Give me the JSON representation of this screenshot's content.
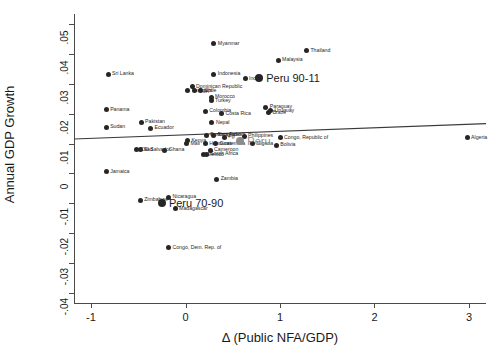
{
  "chart_data": {
    "type": "scatter",
    "title": "",
    "xlabel": "Δ (Public NFA/GDP)",
    "ylabel": "Annual GDP Growth",
    "xlim": [
      -1.18,
      3.18
    ],
    "ylim": [
      -0.0435,
      0.0535
    ],
    "xticks": [
      -1,
      0,
      1,
      2,
      3
    ],
    "xticklabels": [
      "-1",
      "0",
      "1",
      "2",
      "3"
    ],
    "yticks": [
      -0.04,
      -0.03,
      -0.02,
      -0.01,
      0,
      0.01,
      0.02,
      0.03,
      0.04,
      0.05
    ],
    "yticklabels": [
      "-.04",
      "-.03",
      "-.02",
      "-.01",
      "0",
      ".01",
      ".02",
      ".03",
      ".04",
      ".05"
    ],
    "grid": false,
    "legend": "none",
    "fit_line": {
      "x0": -1.18,
      "y0": 0.01155,
      "x1": 3.18,
      "y1": 0.01672
    },
    "points": [
      {
        "label": "Myanmar",
        "x": 0.3,
        "y": 0.0435,
        "size": "small",
        "color": "#262626",
        "label_side": "right"
      },
      {
        "label": "Thailand",
        "x": 1.28,
        "y": 0.0412,
        "size": "small",
        "color": "#262626",
        "label_side": "right"
      },
      {
        "label": "Malaysia",
        "x": 0.98,
        "y": 0.038,
        "size": "small",
        "color": "#262626",
        "label_side": "right"
      },
      {
        "label": "Sri Lanka",
        "x": -0.82,
        "y": 0.0333,
        "size": "small",
        "color": "#262626",
        "label_side": "right"
      },
      {
        "label": "Indonesia",
        "x": 0.3,
        "y": 0.0333,
        "size": "small",
        "color": "#262626",
        "label_side": "right"
      },
      {
        "label": "India",
        "x": 0.63,
        "y": 0.0318,
        "size": "small",
        "color": "#262626",
        "label_side": "right"
      },
      {
        "label": "Peru 90-11",
        "x": 0.78,
        "y": 0.032,
        "size": "big",
        "color": "#262626",
        "label_side": "right"
      },
      {
        "label": "Dominican Republic",
        "x": 0.07,
        "y": 0.029,
        "size": "small",
        "color": "#262626",
        "label_side": "right"
      },
      {
        "label": "Tunisia",
        "x": 0.02,
        "y": 0.0277,
        "size": "small",
        "color": "#262626",
        "label_side": "right"
      },
      {
        "label": "Egypt",
        "x": 0.1,
        "y": 0.0277,
        "size": "small",
        "color": "#262626",
        "label_side": "right"
      },
      {
        "label": "Chile",
        "x": 0.16,
        "y": 0.0277,
        "size": "small",
        "color": "#262626",
        "label_side": "right"
      },
      {
        "label": "Morocco",
        "x": 0.27,
        "y": 0.0255,
        "size": "small",
        "color": "#262626",
        "label_side": "right"
      },
      {
        "label": "Turkey",
        "x": 0.27,
        "y": 0.0243,
        "size": "small",
        "color": "#262626",
        "label_side": "right"
      },
      {
        "label": "Panama",
        "x": -0.84,
        "y": 0.0213,
        "size": "small",
        "color": "#262626",
        "label_side": "right"
      },
      {
        "label": "Colombia",
        "x": 0.21,
        "y": 0.0208,
        "size": "small",
        "color": "#262626",
        "label_side": "right"
      },
      {
        "label": "Costa Rica",
        "x": 0.38,
        "y": 0.02,
        "size": "small",
        "color": "#262626",
        "label_side": "right"
      },
      {
        "label": "Paraguay",
        "x": 0.85,
        "y": 0.0222,
        "size": "small",
        "color": "#262626",
        "label_side": "right"
      },
      {
        "label": "Uruguay",
        "x": 0.9,
        "y": 0.021,
        "size": "small",
        "color": "#262626",
        "label_side": "right"
      },
      {
        "label": "Brazil",
        "x": 0.88,
        "y": 0.0203,
        "size": "small",
        "color": "#262626",
        "label_side": "right"
      },
      {
        "label": "Pakistan",
        "x": -0.47,
        "y": 0.0172,
        "size": "small",
        "color": "#262626",
        "label_side": "right"
      },
      {
        "label": "Nepal",
        "x": 0.28,
        "y": 0.017,
        "size": "small",
        "color": "#262626",
        "label_side": "right"
      },
      {
        "label": "Sudan",
        "x": -0.84,
        "y": 0.0155,
        "size": "small",
        "color": "#262626",
        "label_side": "right"
      },
      {
        "label": "Ecuador",
        "x": -0.37,
        "y": 0.0152,
        "size": "small",
        "color": "#262626",
        "label_side": "right"
      },
      {
        "label": "Burkina Faso",
        "x": 0.22,
        "y": 0.0128,
        "size": "small",
        "color": "#262626",
        "label_side": "right"
      },
      {
        "label": "Bangladesh",
        "x": 0.3,
        "y": 0.0128,
        "size": "small",
        "color": "#262626",
        "label_side": "right"
      },
      {
        "label": "Fiji",
        "x": 0.41,
        "y": 0.0122,
        "size": "small",
        "color": "#262626",
        "label_side": "right"
      },
      {
        "label": "Philippines",
        "x": 0.62,
        "y": 0.0125,
        "size": "small",
        "color": "#262626",
        "label_side": "right"
      },
      {
        "label": "Congo, Republic of",
        "x": 1.0,
        "y": 0.012,
        "size": "small",
        "color": "#262626",
        "label_side": "right"
      },
      {
        "label": "Algeria",
        "x": 2.98,
        "y": 0.012,
        "size": "small",
        "color": "#262626",
        "label_side": "right"
      },
      {
        "label": "Kenya",
        "x": 0.02,
        "y": 0.011,
        "size": "small",
        "color": "#262626",
        "label_side": "right"
      },
      {
        "label": "Mali",
        "x": 0.01,
        "y": 0.01,
        "size": "small",
        "color": "#262626",
        "label_side": "right"
      },
      {
        "label": "Honduras",
        "x": 0.21,
        "y": 0.01,
        "size": "small",
        "color": "#262626",
        "label_side": "right"
      },
      {
        "label": "Guatemala",
        "x": 0.32,
        "y": 0.01,
        "size": "small",
        "color": "#262626",
        "label_side": "right"
      },
      {
        "label": "Nigeria",
        "x": 0.71,
        "y": 0.01,
        "size": "small",
        "color": "#262626",
        "label_side": "right"
      },
      {
        "label": "Bolivia",
        "x": 0.96,
        "y": 0.0095,
        "size": "small",
        "color": "#262626",
        "label_side": "right"
      },
      {
        "label": "Peru",
        "x": 0.58,
        "y": 0.0108,
        "size": "big",
        "color": "#8c8c8c",
        "label_side": "right"
      },
      {
        "label": "Chad",
        "x": -0.52,
        "y": 0.008,
        "size": "small",
        "color": "#262626",
        "label_side": "right"
      },
      {
        "label": "El Salvador",
        "x": -0.48,
        "y": 0.008,
        "size": "small",
        "color": "#262626",
        "label_side": "right"
      },
      {
        "label": "Ghana",
        "x": -0.22,
        "y": 0.0078,
        "size": "small",
        "color": "#262626",
        "label_side": "right"
      },
      {
        "label": "Cameroon",
        "x": 0.26,
        "y": 0.0078,
        "size": "small",
        "color": "#262626",
        "label_side": "right"
      },
      {
        "label": "South Africa",
        "x": 0.22,
        "y": 0.0065,
        "size": "small",
        "color": "#262626",
        "label_side": "right"
      },
      {
        "label": "Mexico",
        "x": 0.19,
        "y": 0.0062,
        "size": "small",
        "color": "#262626",
        "label_side": "right"
      },
      {
        "label": "Jamaica",
        "x": -0.84,
        "y": 0.0005,
        "size": "small",
        "color": "#262626",
        "label_side": "right"
      },
      {
        "label": "Zambia",
        "x": 0.33,
        "y": -0.002,
        "size": "small",
        "color": "#262626",
        "label_side": "right"
      },
      {
        "label": "Nicaragua",
        "x": -0.18,
        "y": -0.008,
        "size": "small",
        "color": "#262626",
        "label_side": "right"
      },
      {
        "label": "Zimbabwe",
        "x": -0.48,
        "y": -0.009,
        "size": "small",
        "color": "#262626",
        "label_side": "right"
      },
      {
        "label": "Peru 70-90",
        "x": -0.25,
        "y": -0.01,
        "size": "big",
        "color": "#262626",
        "label_side": "right"
      },
      {
        "label": "Madagascar",
        "x": -0.11,
        "y": -0.0118,
        "size": "small",
        "color": "#262626",
        "label_side": "right"
      },
      {
        "label": "Congo, Dem. Rep. of",
        "x": -0.18,
        "y": -0.025,
        "size": "small",
        "color": "#262626",
        "label_side": "right"
      }
    ]
  }
}
